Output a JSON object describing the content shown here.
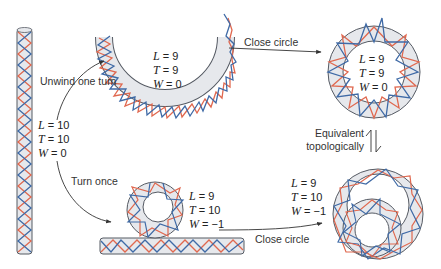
{
  "colors": {
    "tube_fill": "#e6e8ec",
    "tube_edge": "#555a63",
    "strand_red": "#e0684f",
    "strand_blue": "#3f6aa6",
    "arrow": "#333333",
    "text": "#333333"
  },
  "states": {
    "straight": {
      "L": "L = 10",
      "T": "T = 10",
      "W": "W = 0"
    },
    "unwound_open": {
      "L": "L = 9",
      "T": "T = 9",
      "W": "W = 0"
    },
    "unwound_closed": {
      "L": "L = 9",
      "T": "T = 9",
      "W": "W = 0"
    },
    "turned_open": {
      "L": "L = 9",
      "T": "T = 10",
      "W": "W = −1"
    },
    "turned_closed": {
      "L": "L = 9",
      "T": "T = 10",
      "W": "W = −1"
    }
  },
  "arrows": {
    "unwind": "Unwind one turn",
    "turn": "Turn once",
    "close_top": "Close circle",
    "close_bottom": "Close circle",
    "equivalent_line1": "Equivalent",
    "equivalent_line2": "topologically"
  }
}
